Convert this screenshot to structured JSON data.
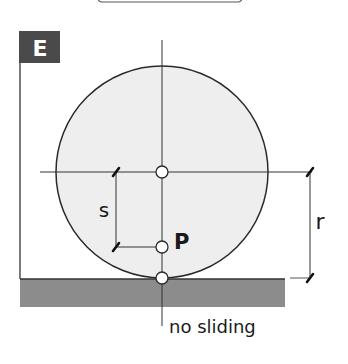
{
  "figure": {
    "panel_label": "E",
    "labels": {
      "s": "s",
      "r": "r",
      "point": "P",
      "annotation": "no sliding"
    },
    "colors": {
      "panel_badge": "#4a4a4a",
      "wheel_fill": "#eeeeee",
      "ground_fill": "#8c8c8c",
      "stroke": "#2a2a2a"
    }
  }
}
